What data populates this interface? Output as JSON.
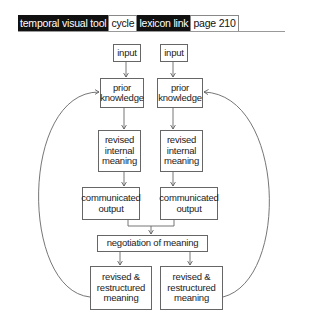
{
  "header": {
    "tabs": [
      {
        "label": "temporal visual tool",
        "style": "dark"
      },
      {
        "label": "cycle",
        "style": "light"
      },
      {
        "label": "lexicon link",
        "style": "dark"
      },
      {
        "label": "page 210",
        "style": "light"
      }
    ]
  },
  "diagram": {
    "left_column": {
      "input": "input",
      "prior_knowledge": "prior knowledge",
      "revised_internal_meaning": "revised internal meaning",
      "communicated_output": "communicated output",
      "revised_restructured_meaning": "revised & restructured meaning"
    },
    "right_column": {
      "input": "input",
      "prior_knowledge": "prior knowledge",
      "revised_internal_meaning": "revised internal meaning",
      "communicated_output": "communicated output",
      "revised_restructured_meaning": "revised & restructured meaning"
    },
    "shared": {
      "negotiation_of_meaning": "negotiation of meaning"
    },
    "colors": {
      "line": "#666666",
      "tab_dark": "#111111",
      "background": "#ffffff"
    }
  }
}
